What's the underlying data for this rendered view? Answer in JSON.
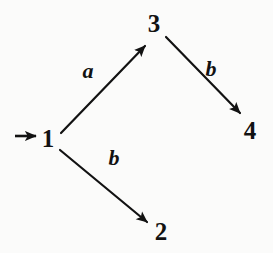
{
  "diagram": {
    "type": "state-transition-automaton",
    "canvas": {
      "width": 273,
      "height": 253
    },
    "colors": {
      "background": "#fbfbfa",
      "ink": "#121212"
    },
    "nodes": [
      {
        "id": "1",
        "label": "1",
        "x": 48,
        "y": 138,
        "start": true
      },
      {
        "id": "3",
        "label": "3",
        "x": 154,
        "y": 23,
        "start": false
      },
      {
        "id": "2",
        "label": "2",
        "x": 161,
        "y": 231,
        "start": false
      },
      {
        "id": "4",
        "label": "4",
        "x": 250,
        "y": 130,
        "start": false
      }
    ],
    "start_marker": {
      "name": "start-arrow",
      "from_x": 15,
      "to_x": 38,
      "y": 136
    },
    "edges": [
      {
        "id": "e-1-3",
        "from": "1",
        "to": "3",
        "label": "a",
        "x1": 61,
        "y1": 133,
        "x2": 146,
        "y2": 45,
        "label_x": 88,
        "label_y": 72
      },
      {
        "id": "e-3-4",
        "from": "3",
        "to": "4",
        "label": "b",
        "x1": 166,
        "y1": 37,
        "x2": 241,
        "y2": 114,
        "label_x": 211,
        "label_y": 70
      },
      {
        "id": "e-1-2",
        "from": "1",
        "to": "2",
        "label": "b",
        "x1": 60,
        "y1": 150,
        "x2": 148,
        "y2": 223,
        "label_x": 114,
        "label_y": 159
      }
    ]
  }
}
